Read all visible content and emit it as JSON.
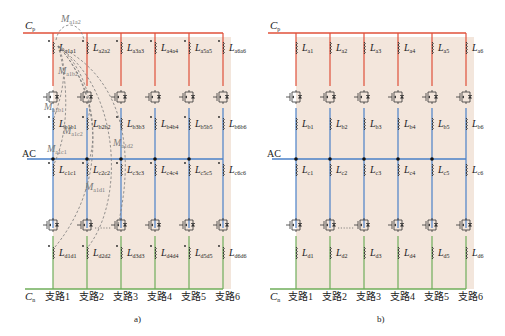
{
  "colors": {
    "background_panel": "#f3e6dc",
    "positive_bus": "#e0503a",
    "ac_bus": "#4a80c8",
    "negative_bus": "#6fae5a",
    "mutual_dashed": "#7a7a7a"
  },
  "panel_a": {
    "caption": "a)",
    "bus_top": {
      "label": "C",
      "sub": "p"
    },
    "bus_mid": {
      "label": "AC"
    },
    "bus_bottom": {
      "label": "C",
      "sub": "n"
    },
    "branches": [
      "支路1",
      "支路2",
      "支路3",
      "支路4",
      "支路5",
      "支路6"
    ],
    "inductors_a": [
      "a1a1",
      "a2a2",
      "a3a3",
      "a4a4",
      "a5a5",
      "a6a6"
    ],
    "inductors_b": [
      "b1b1",
      "b2b2",
      "b3b3",
      "b4b4",
      "b5b5",
      "b6b6"
    ],
    "inductors_c": [
      "c1c1",
      "c2c2",
      "c3c3",
      "c4c4",
      "c5c5",
      "c6c6"
    ],
    "inductors_d": [
      "d1d1",
      "d2d2",
      "d3d3",
      "d4d4",
      "d5d5",
      "d6d6"
    ],
    "mutuals": [
      {
        "label": "M",
        "sub": "a1a2"
      },
      {
        "label": "M",
        "sub": "a1b2"
      },
      {
        "label": "M",
        "sub": "a1b1"
      },
      {
        "label": "M",
        "sub": "a1c2"
      },
      {
        "label": "M",
        "sub": "a1c1"
      },
      {
        "label": "M",
        "sub": "a1d2"
      },
      {
        "label": "M",
        "sub": "a1d1"
      }
    ]
  },
  "panel_b": {
    "caption": "b)",
    "bus_top": {
      "label": "C",
      "sub": "p"
    },
    "bus_mid": {
      "label": "AC"
    },
    "bus_bottom": {
      "label": "C",
      "sub": "n"
    },
    "branches": [
      "支路1",
      "支路2",
      "支路3",
      "支路4",
      "支路5",
      "支路6"
    ],
    "inductors_a": [
      "a1",
      "a2",
      "a3",
      "a4",
      "a5",
      "a6"
    ],
    "inductors_b": [
      "b1",
      "b2",
      "b3",
      "b4",
      "b5",
      "b6"
    ],
    "inductors_c": [
      "c1",
      "c2",
      "c3",
      "c4",
      "c5",
      "c6"
    ],
    "inductors_d": [
      "d1",
      "d2",
      "d3",
      "d4",
      "d5",
      "d6"
    ]
  }
}
